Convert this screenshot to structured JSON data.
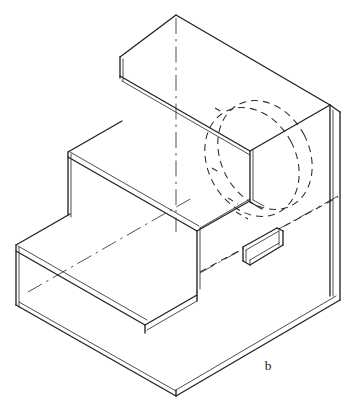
{
  "figure": {
    "label": "b",
    "label_x": 268,
    "label_y": 370,
    "background_color": "#ffffff",
    "visible_line_color": "#232323",
    "hidden_line_color": "#2b2b2b",
    "center_line_color": "#474747",
    "canvas": {
      "width": 358,
      "height": 415
    }
  },
  "geometry": {
    "description": "Three-tier stepped solid drawn in isometric projection. Each step face is drawn with a doubled edge line indicating material thickness. A hidden circular through-hole is shown as two dashed ellipses on the tall back wall, and a small rectangular keyway slot projects from the middle step riser.",
    "outline": "M 176,15 L 330,105 L 330,112 L 340,118 L 340,300 L 176,396 L 172,394 L 16,305 L 16,245 L 68,215 L 68,152 L 120,122 L 120,57 Z",
    "top_face": "M 176,15 L 330,105 L 248,152 L 120,77 Z",
    "top_face_left": "M 120,57 L 176,15 L 176,22 L 120,64 Z",
    "tall_back_wall_right": "M 330,105 L 340,112 L 340,300 L 330,294 Z",
    "middle_tread": "M 68,152 L 196,226 L 258,190 L 131,116 Z",
    "lower_tread": "M 16,245 L 144,319 L 205,283 L 78,209 Z",
    "bottom_front_left": "M 16,305 L 176,396 L 176,390 L 16,299 Z",
    "riser_upper": "M 120,77 L 248,152 L 248,214 L 120,139 Z",
    "riser_lower": "M 68,209 L 196,283 L 196,290 L 68,216 Z"
  },
  "edges": {
    "visible": [
      {
        "name": "top-apex-left",
        "d": "M 120,57 L 176,15"
      },
      {
        "name": "top-apex-right",
        "d": "M 176,15 L 330,105"
      },
      {
        "name": "top-face-front-right",
        "d": "M 330,105 L 248,152"
      },
      {
        "name": "top-face-front-left",
        "d": "M 248,152 L 120,78"
      },
      {
        "name": "upper-riser-left-vertical",
        "d": "M 120,57 L 120,78"
      },
      {
        "name": "upper-riser-left-vertical-inner",
        "d": "M 123,59 L 123,80"
      },
      {
        "name": "tall-wall-right-outer",
        "d": "M 330,105 L 340,112"
      },
      {
        "name": "tall-wall-right-edge",
        "d": "M 340,112 L 340,300"
      },
      {
        "name": "tall-wall-right-inner",
        "d": "M 333,110 L 333,296"
      },
      {
        "name": "tall-wall-bottom-right",
        "d": "M 340,300 L 176,396"
      },
      {
        "name": "tall-wall-bottom-right-inner",
        "d": "M 337,296 L 176,390"
      },
      {
        "name": "middle-tread-back-left",
        "d": "M 68,152 L 120,122"
      },
      {
        "name": "middle-tread-front-left",
        "d": "M 68,158 L 196,232"
      },
      {
        "name": "middle-tread-front-left-inner",
        "d": "M 70,154 L 198,228"
      },
      {
        "name": "middle-riser-vertical",
        "d": "M 68,152 L 68,215"
      },
      {
        "name": "middle-riser-vertical-inner",
        "d": "M 71,154 L 71,217"
      },
      {
        "name": "lower-tread-back-left",
        "d": "M 16,245 L 68,215"
      },
      {
        "name": "lower-tread-front-left",
        "d": "M 16,251 L 144,325"
      },
      {
        "name": "lower-tread-front-left-inner",
        "d": "M 18,247 L 146,321"
      },
      {
        "name": "lower-riser-left-vertical",
        "d": "M 16,245 L 16,305"
      },
      {
        "name": "lower-riser-left-vertical-inner",
        "d": "M 19,247 L 19,307"
      },
      {
        "name": "bottom-front-left",
        "d": "M 16,305 L 176,396"
      },
      {
        "name": "bottom-front-left-inner",
        "d": "M 19,303 L 176,390"
      },
      {
        "name": "middle-step-right-vertical",
        "d": "M 196,232 L 196,290"
      },
      {
        "name": "middle-step-right-vertical-inner",
        "d": "M 199,230 L 199,288"
      },
      {
        "name": "middle-step-top-right",
        "d": "M 196,232 L 248,202"
      },
      {
        "name": "middle-step-top-right-upper",
        "d": "M 198,228 L 250,198"
      },
      {
        "name": "upper-riser-bottom",
        "d": "M 248,152 L 248,210"
      },
      {
        "name": "upper-riser-bottom-inner",
        "d": "M 251,150 L 251,208"
      },
      {
        "name": "upper-riser-step-out",
        "d": "M 248,210 L 276,226"
      },
      {
        "name": "lower-step-right-vertical",
        "d": "M 144,325 L 144,332"
      },
      {
        "name": "lower-step-bottom-right",
        "d": "M 144,325 L 196,295"
      },
      {
        "name": "lower-step-corner-vertical",
        "d": "M 196,290 L 196,296"
      },
      {
        "name": "bottom-apex-vertical",
        "d": "M 176,390 L 176,396"
      }
    ],
    "hidden": [
      {
        "name": "hidden-hole-ellipse-front",
        "type": "ellipse",
        "cx": 252,
        "cy": 162,
        "rx": 44,
        "ry": 57,
        "rotation": -28
      },
      {
        "name": "hidden-hole-ellipse-back",
        "type": "ellipse",
        "cx": 266,
        "cy": 156,
        "rx": 44,
        "ry": 57,
        "rotation": -28
      },
      {
        "name": "hidden-slot-depth-a",
        "type": "line",
        "d": "M 228,178 L 246,188"
      },
      {
        "name": "hidden-slot-depth-b",
        "type": "line",
        "d": "M 232,200 L 254,212"
      },
      {
        "name": "hidden-bottom-edge-right",
        "type": "line",
        "d": "M 196,290 L 340,206"
      },
      {
        "name": "hidden-bottom-rear",
        "type": "line",
        "d": "M 210,262 L 340,300"
      }
    ],
    "center_lines": [
      {
        "name": "vertical-hole-centerline-top",
        "d": "M 176,18 L 176,232"
      },
      {
        "name": "lower-tread-centerline",
        "d": "M 30,290 L 190,198"
      },
      {
        "name": "lower-diagonal-centerline",
        "d": "M 198,272 L 336,196"
      }
    ]
  },
  "features": {
    "through_hole": {
      "name": "hidden circular through hole",
      "style": "dashed",
      "count": 2
    },
    "keyway_slot": {
      "name": "rectangular keyway slot",
      "style": "visible solid",
      "outer": "M 244,247 L 276,229 L 282,232 L 282,245 L 250,263 L 244,260 Z",
      "inner": "M 250,250 L 276,235 L 278,237 L 278,243 L 252,258 L 250,256 Z",
      "edges": [
        {
          "name": "slot-top-edge",
          "d": "M 244,247 L 276,229"
        },
        {
          "name": "slot-top-edge-inner",
          "d": "M 247,249 L 278,231"
        },
        {
          "name": "slot-right-vertical",
          "d": "M 281,231 L 281,244"
        },
        {
          "name": "slot-right-vertical-inner",
          "d": "M 278,233 L 278,245"
        },
        {
          "name": "slot-bottom-edge",
          "d": "M 250,263 L 281,245"
        },
        {
          "name": "slot-bottom-edge-inner",
          "d": "M 250,259 L 278,243"
        },
        {
          "name": "slot-left-vertical",
          "d": "M 244,247 L 244,260"
        },
        {
          "name": "slot-left-vertical-inner",
          "d": "M 247,249 L 247,261"
        },
        {
          "name": "slot-inner-floor",
          "d": "M 250,257 L 278,241"
        },
        {
          "name": "slot-mouth-left",
          "d": "M 244,260 L 250,263"
        }
      ]
    }
  }
}
